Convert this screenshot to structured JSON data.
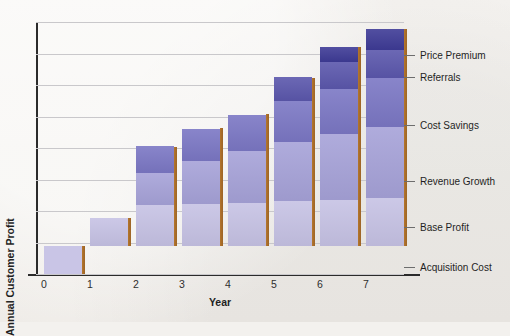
{
  "chart_data": {
    "type": "bar",
    "subtype": "stacked-bar",
    "title": "",
    "xlabel": "Year",
    "ylabel": "Annual Customer Profit",
    "categories": [
      "0",
      "1",
      "2",
      "3",
      "4",
      "5",
      "6",
      "7"
    ],
    "xticklabels": [
      "0",
      "1",
      "2",
      "3",
      "4",
      "5",
      "6",
      "7"
    ],
    "ytick_labels": [],
    "ylim": [
      -1.0,
      8.0
    ],
    "grid": "horizontal",
    "gridline_count": 8,
    "legend_position": "right-annotations",
    "series": [
      {
        "name": "Acquisition Cost",
        "color": "#c9c5e6",
        "values": [
          -1.0,
          0,
          0,
          0,
          0,
          0,
          0,
          0
        ]
      },
      {
        "name": "Base Profit",
        "color": "#c6c2e4",
        "values": [
          0,
          1.0,
          1.45,
          1.5,
          1.55,
          1.6,
          1.65,
          1.7
        ]
      },
      {
        "name": "Revenue Growth",
        "color": "#a6a2d8",
        "values": [
          0,
          0,
          1.15,
          1.55,
          1.85,
          2.1,
          2.35,
          2.55
        ]
      },
      {
        "name": "Cost Savings",
        "color": "#7b77c4",
        "values": [
          0,
          0,
          0.95,
          1.15,
          1.3,
          1.45,
          1.6,
          1.75
        ]
      },
      {
        "name": "Referrals",
        "color": "#5b57ac",
        "values": [
          0,
          0,
          0,
          0,
          0,
          0.85,
          0.95,
          1.0
        ]
      },
      {
        "name": "Price Premium",
        "color": "#3e3b96",
        "values": [
          0,
          0,
          0,
          0,
          0,
          0,
          0.55,
          0.75
        ]
      }
    ],
    "bar_totals": [
      -1.0,
      1.0,
      3.55,
      4.2,
      4.7,
      6.0,
      7.1,
      7.75
    ],
    "annotations": [
      {
        "label": "Price Premium",
        "has_tick": true
      },
      {
        "label": "Referrals",
        "has_tick": true
      },
      {
        "label": "Cost Savings",
        "has_tick": true
      },
      {
        "label": "Revenue Growth",
        "has_tick": true
      },
      {
        "label": "Base Profit",
        "has_tick": true
      },
      {
        "label": "Acquisition Cost",
        "has_tick": true
      }
    ],
    "colors": {
      "acquisition_cost": "#c9c5e6",
      "base_profit": "#c6c2e4",
      "revenue_growth": "#a6a2d8",
      "cost_savings": "#7b77c4",
      "referrals": "#5b57ac",
      "price_premium": "#3e3b96",
      "bar_shadow": "#a96c28",
      "axis": "#2b2b2b",
      "gridline": "#c9c8cb",
      "background": "#f4f2ef",
      "text": "#1f1f1f"
    }
  }
}
